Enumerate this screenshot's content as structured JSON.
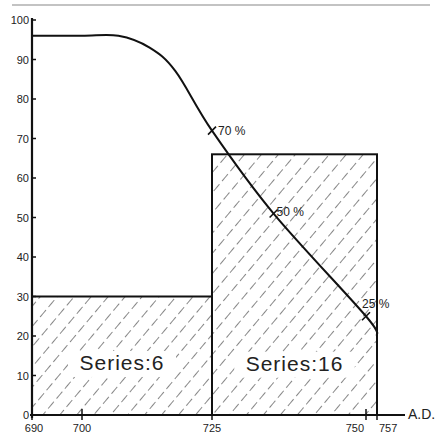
{
  "chart_data": {
    "type": "bar",
    "title": "",
    "xlabel": "A.D.",
    "ylabel": "",
    "ylim": [
      0,
      100
    ],
    "xlim": [
      690,
      757
    ],
    "grid": false,
    "y_ticks": [
      "0",
      "10",
      "20",
      "30",
      "40",
      "50",
      "60",
      "70",
      "80",
      "90",
      "100"
    ],
    "x_ticks": [
      "690",
      "700",
      "725",
      "750",
      "757"
    ],
    "bars": [
      {
        "label": "Series:6",
        "x_start": 690,
        "x_end": 725,
        "value": 30
      },
      {
        "label": "Series:16",
        "x_start": 725,
        "x_end": 757,
        "value": 66
      }
    ],
    "curve": {
      "type": "line",
      "points": [
        {
          "x": 690,
          "y": 96
        },
        {
          "x": 700,
          "y": 96
        },
        {
          "x": 707,
          "y": 96
        },
        {
          "x": 713,
          "y": 93
        },
        {
          "x": 718,
          "y": 87
        },
        {
          "x": 725,
          "y": 72
        },
        {
          "x": 735,
          "y": 51
        },
        {
          "x": 750,
          "y": 25
        },
        {
          "x": 757,
          "y": 20
        }
      ],
      "annotations": [
        {
          "label": "70 %",
          "x": 725,
          "y": 72
        },
        {
          "label": "50 %",
          "x": 735,
          "y": 51
        },
        {
          "label": "25 %",
          "x": 750,
          "y": 25
        }
      ]
    }
  }
}
